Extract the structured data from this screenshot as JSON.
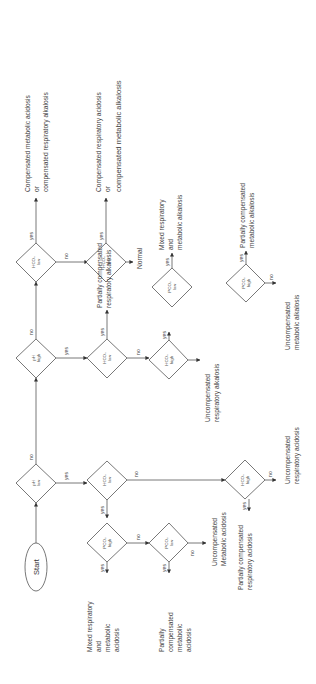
{
  "diagram": {
    "orientation": "rotated 90 degrees counter-clockwise",
    "start_label": "Start",
    "edge_labels": {
      "yes": "yes",
      "no": "no"
    },
    "decisions": {
      "ph_low": {
        "line1": "pH",
        "line2": "low"
      },
      "ph_high": {
        "line1": "pH",
        "line2": "high"
      },
      "hco3_low_a": {
        "line1": "HCO₃",
        "line2": "low"
      },
      "hco3_low_b": {
        "line1": "HCO₃",
        "line2": "low"
      },
      "hco3_low_c": {
        "line1": "HCO₃",
        "line2": "low"
      },
      "hco3_high_c": {
        "line1": "HCO₃",
        "line2": "high"
      },
      "pco2_low_c": {
        "line1": "PCO₂",
        "line2": "low"
      },
      "pco2_high_d": {
        "line1": "PCO₂",
        "line2": "high"
      },
      "hco3_low_e": {
        "line1": "HCO₃",
        "line2": "low"
      },
      "pco2_high_e": {
        "line1": "PCO₂",
        "line2": "high"
      },
      "pco2_low_f": {
        "line1": "PCO₂",
        "line2": "low"
      },
      "hco3_high_g": {
        "line1": "HCO₃",
        "line2": "high"
      }
    },
    "outcomes": {
      "comp_met_acid": [
        "Compensated metabolic acidosis",
        "or",
        "compensated respiratory alkalosis"
      ],
      "comp_resp_acid": [
        "Compensated respiratory acidosis",
        "or",
        "compensated metabolic alkalosis"
      ],
      "normal": [
        "Normal"
      ],
      "partial_resp_alk": [
        "Partially compensated",
        "respiratory alkalosis"
      ],
      "mixed_alk": [
        "Mixed respiratory",
        "and",
        "metabolic alkalosis"
      ],
      "uncomp_resp_alk": [
        "Uncompensated",
        "respiratory alkalosis"
      ],
      "partial_met_alk": [
        "Partially compensated",
        "metabolic alkalosis"
      ],
      "uncomp_met_alk": [
        "Uncompensated",
        "metabolic alkalosis"
      ],
      "mixed_acid": [
        "Mixed respiratory",
        "and",
        "metabolic",
        "acidosis"
      ],
      "partial_met_acid": [
        "Partially",
        "compensated",
        "metabolic",
        "acidosis"
      ],
      "uncomp_met_acid": [
        "Uncompensated",
        "Metabolic acidosis"
      ],
      "partial_resp_acid": [
        "Partially compensated",
        "respiratory acidosis"
      ],
      "uncomp_resp_acid": [
        "Uncompensated",
        "respiratory acidosis"
      ]
    }
  }
}
